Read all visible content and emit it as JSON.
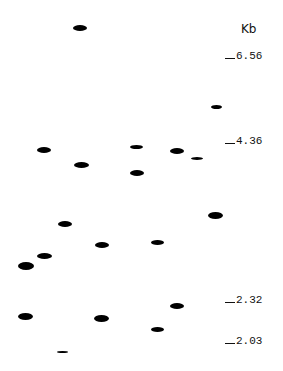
{
  "figure": {
    "type": "gel-electrophoresis",
    "unit_label": "Kb",
    "markers": [
      {
        "label": "6.56",
        "y": 56
      },
      {
        "label": "4.36",
        "y": 141
      },
      {
        "label": "2.32",
        "y": 300
      },
      {
        "label": "2.03",
        "y": 341
      }
    ],
    "bands": [
      {
        "x": 73,
        "y": 25,
        "w": 14,
        "h": 6
      },
      {
        "x": 37,
        "y": 147,
        "w": 14,
        "h": 6
      },
      {
        "x": 74,
        "y": 162,
        "w": 15,
        "h": 6
      },
      {
        "x": 130,
        "y": 145,
        "w": 13,
        "h": 4
      },
      {
        "x": 130,
        "y": 170,
        "w": 14,
        "h": 6
      },
      {
        "x": 170,
        "y": 148,
        "w": 14,
        "h": 6
      },
      {
        "x": 191,
        "y": 157,
        "w": 12,
        "h": 3
      },
      {
        "x": 211,
        "y": 105,
        "w": 11,
        "h": 4
      },
      {
        "x": 208,
        "y": 212,
        "w": 15,
        "h": 7
      },
      {
        "x": 58,
        "y": 221,
        "w": 14,
        "h": 6
      },
      {
        "x": 95,
        "y": 242,
        "w": 14,
        "h": 6
      },
      {
        "x": 151,
        "y": 240,
        "w": 13,
        "h": 5
      },
      {
        "x": 37,
        "y": 253,
        "w": 15,
        "h": 6
      },
      {
        "x": 18,
        "y": 262,
        "w": 16,
        "h": 8
      },
      {
        "x": 170,
        "y": 303,
        "w": 14,
        "h": 6
      },
      {
        "x": 18,
        "y": 313,
        "w": 15,
        "h": 7
      },
      {
        "x": 94,
        "y": 315,
        "w": 15,
        "h": 7
      },
      {
        "x": 151,
        "y": 327,
        "w": 13,
        "h": 5
      },
      {
        "x": 57,
        "y": 351,
        "w": 11,
        "h": 2
      }
    ]
  }
}
